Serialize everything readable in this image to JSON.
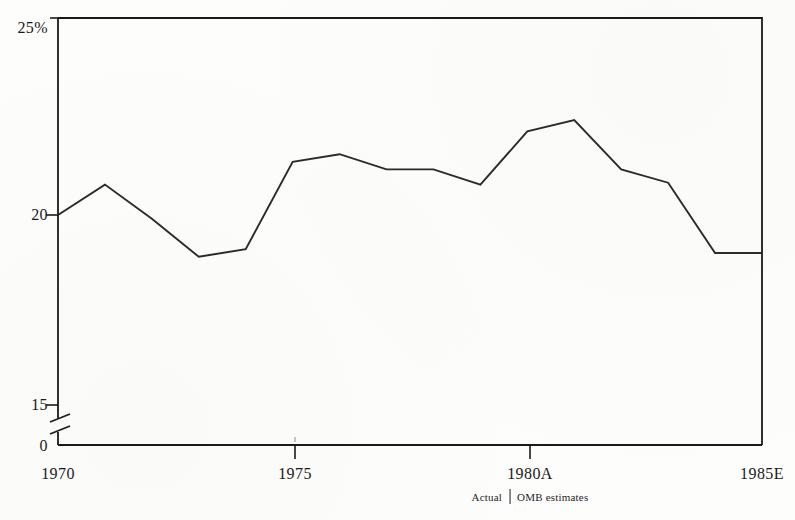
{
  "chart_data": {
    "type": "line",
    "title": "",
    "subtitle": "",
    "xlabel": "",
    "ylabel": "",
    "grid": false,
    "legend": "none",
    "axis_break": true,
    "axis_break_between": [
      0,
      15
    ],
    "ylim": [
      15,
      25
    ],
    "yticks": [
      "0",
      "15",
      "20",
      "25%"
    ],
    "ytick_values": [
      0,
      15,
      20,
      25
    ],
    "xlim": [
      1970,
      1985
    ],
    "xticks": [
      "1970",
      "1975",
      "1980A",
      "1985E"
    ],
    "xtick_values": [
      1970,
      1975,
      1980,
      1985
    ],
    "x": [
      1970,
      1971,
      1972,
      1973,
      1974,
      1975,
      1976,
      1977,
      1978,
      1979,
      1980,
      1981,
      1982,
      1983,
      1984,
      1985
    ],
    "values": [
      20.0,
      20.8,
      19.9,
      18.9,
      19.1,
      21.4,
      21.6,
      21.2,
      21.2,
      20.8,
      22.2,
      22.5,
      21.2,
      20.85,
      19.0,
      19.0
    ],
    "series": [
      {
        "name": "Federal outlays as percent of GNP",
        "values": [
          20.0,
          20.8,
          19.9,
          18.9,
          19.1,
          21.4,
          21.6,
          21.2,
          21.2,
          20.8,
          22.2,
          22.5,
          21.2,
          20.85,
          19.0,
          19.0
        ]
      }
    ],
    "annotations": {
      "divider_note_left": "Actual",
      "divider_note_right": "OMB estimates"
    },
    "colors": {
      "line": "#2a2a2a",
      "axis": "#1a1a1a",
      "background": "#fdfdfc"
    }
  },
  "axes": {
    "y_labels": [
      {
        "text": "25%",
        "value": 25
      },
      {
        "text": "20",
        "value": 20
      },
      {
        "text": "15",
        "value": 15
      },
      {
        "text": "0",
        "value": 0
      }
    ],
    "x_labels": [
      {
        "text": "1970",
        "value": 1970
      },
      {
        "text": "1975",
        "value": 1975
      },
      {
        "text": "1980A",
        "value": 1980
      },
      {
        "text": "1985E",
        "value": 1985
      }
    ]
  },
  "footnote": {
    "left": "Actual",
    "right": "OMB estimates"
  }
}
